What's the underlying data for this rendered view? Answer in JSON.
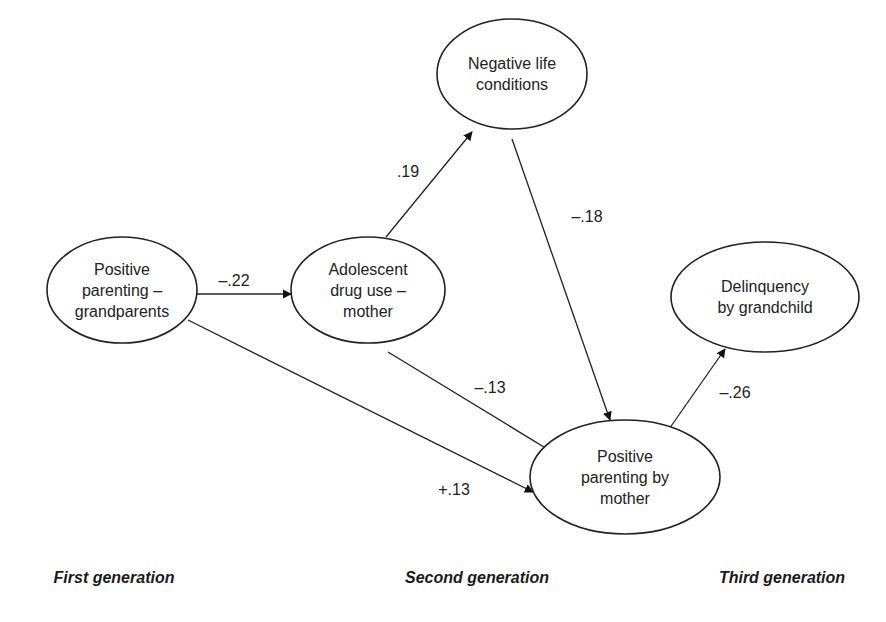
{
  "nodes": [
    {
      "id": "gp",
      "label_lines": [
        "Positive",
        "parenting –",
        "grandparents"
      ],
      "cx": 122,
      "cy": 290,
      "rx": 75,
      "ry": 53
    },
    {
      "id": "drug",
      "label_lines": [
        "Adolescent",
        "drug use –",
        "mother"
      ],
      "cx": 368,
      "cy": 290,
      "rx": 77,
      "ry": 53
    },
    {
      "id": "neg",
      "label_lines": [
        "Negative life",
        "conditions"
      ],
      "cx": 512,
      "cy": 74,
      "rx": 75,
      "ry": 55
    },
    {
      "id": "delinq",
      "label_lines": [
        "Delinquency",
        "by grandchild"
      ],
      "cx": 765,
      "cy": 297,
      "rx": 94,
      "ry": 55
    },
    {
      "id": "mother",
      "label_lines": [
        "Positive",
        "parenting by",
        "mother"
      ],
      "cx": 625,
      "cy": 477,
      "rx": 95,
      "ry": 57
    }
  ],
  "edges": [
    {
      "from": "gp",
      "to": "drug",
      "label": "–.22",
      "x1": 197,
      "y1": 294,
      "x2": 291,
      "y2": 294,
      "lx": 234,
      "ly": 281
    },
    {
      "from": "drug",
      "to": "neg",
      "label": ".19",
      "x1": 386,
      "y1": 237,
      "x2": 472,
      "y2": 132,
      "lx": 408,
      "ly": 172
    },
    {
      "from": "neg",
      "to": "mother",
      "label": "–.18",
      "x1": 512,
      "y1": 139,
      "x2": 610,
      "y2": 420,
      "lx": 587,
      "ly": 217
    },
    {
      "from": "drug",
      "to": "mother",
      "label": "–.13",
      "x1": 388,
      "y1": 352,
      "x2": 557,
      "y2": 455,
      "lx": 490,
      "ly": 388
    },
    {
      "from": "gp",
      "to": "mother",
      "label": "+.13",
      "x1": 188,
      "y1": 320,
      "x2": 533,
      "y2": 492,
      "lx": 454,
      "ly": 490
    },
    {
      "from": "mother",
      "to": "delinq",
      "label": "–.26",
      "x1": 660,
      "y1": 442,
      "x2": 725,
      "y2": 349,
      "lx": 735,
      "ly": 393
    }
  ],
  "generations": [
    {
      "label": "First generation",
      "x": 114,
      "y": 578
    },
    {
      "label": "Second generation",
      "x": 477,
      "y": 578
    },
    {
      "label": "Third generation",
      "x": 782,
      "y": 578
    }
  ]
}
